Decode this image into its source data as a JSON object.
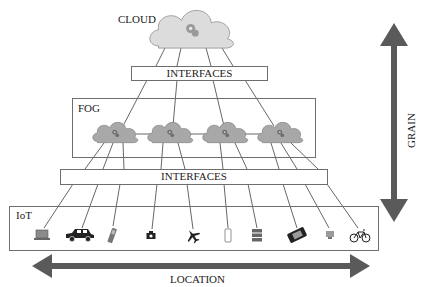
{
  "layers": {
    "cloud": {
      "label": "CLOUD"
    },
    "top_interfaces": {
      "label": "INTERFACES"
    },
    "fog": {
      "label": "FOG",
      "node_count": 4
    },
    "bottom_interfaces": {
      "label": "INTERFACES"
    },
    "iot": {
      "label": "IoT"
    }
  },
  "axes": {
    "vertical": {
      "label": "GRAIN"
    },
    "horizontal": {
      "label": "LOCATION"
    }
  },
  "iot_devices": [
    {
      "name": "laptop",
      "icon": "laptop-icon"
    },
    {
      "name": "car",
      "icon": "car-icon"
    },
    {
      "name": "mobile-phone",
      "icon": "mobile-phone-icon"
    },
    {
      "name": "camera",
      "icon": "camera-icon"
    },
    {
      "name": "airplane",
      "icon": "airplane-icon"
    },
    {
      "name": "smartphone",
      "icon": "smartphone-icon"
    },
    {
      "name": "server",
      "icon": "server-icon"
    },
    {
      "name": "desk-phone",
      "icon": "desk-phone-icon"
    },
    {
      "name": "computer",
      "icon": "computer-icon"
    },
    {
      "name": "bicycle",
      "icon": "bicycle-icon"
    }
  ],
  "colors": {
    "cloud_fill": "#d6d6d6",
    "fog_cloud_fill": "#a9a9a9",
    "arrow": "#5a5a5a",
    "line": "#555555",
    "box_border": "#6e6e6e"
  }
}
